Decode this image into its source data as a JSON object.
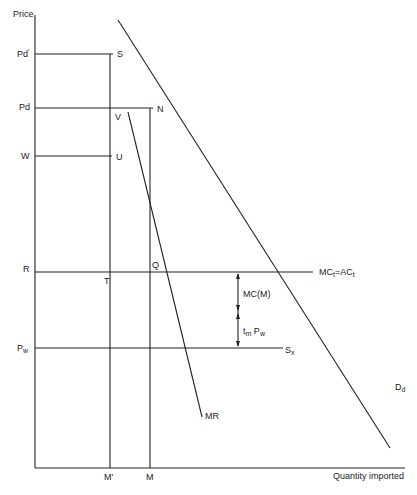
{
  "axes": {
    "y_label": "Price",
    "x_label": "Quantity imported"
  },
  "price_levels": {
    "pd_prime": "Pd",
    "pd_prime_mark": "'",
    "pd": "Pd",
    "w": "W",
    "r": "R",
    "pw_main": "P",
    "pw_sub": "w"
  },
  "quantity_levels": {
    "m_prime": "M'",
    "m": "M"
  },
  "points": {
    "s": "S",
    "n": "N",
    "v": "V",
    "u": "U",
    "q": "Q",
    "t": "T"
  },
  "curves": {
    "mc_main1": "MC",
    "mc_sub1": "t",
    "mc_eq": "=AC",
    "mc_sub2": "t",
    "sx_main": "S",
    "sx_sub": "x",
    "dd_main": "D",
    "dd_sub": "d",
    "mr": "MR"
  },
  "annotations": {
    "mcm": "MC(M)",
    "tm_main": "t",
    "tm_sub": "m",
    "tm_pw": " P",
    "tm_pw_sub": "w"
  },
  "colors": {
    "line": "#222222",
    "background": "#ffffff"
  }
}
